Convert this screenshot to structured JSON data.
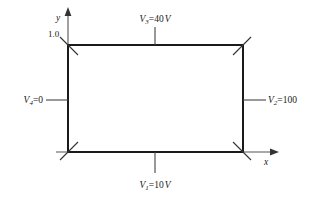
{
  "figure": {
    "type": "boundary-value-diagram",
    "stroke_color": "#1a1a1a",
    "background_color": "#ffffff"
  },
  "axes": {
    "x_label": "x",
    "y_label": "y",
    "y_tick_label": "1.0"
  },
  "boundaries": {
    "top": {
      "symbol": "V",
      "subscript": "3",
      "equals": "=40",
      "unit": "V",
      "full_text": "V3=40 V"
    },
    "right": {
      "symbol": "V",
      "subscript": "2",
      "equals": "=100",
      "unit": "",
      "full_text": "V2=100"
    },
    "bottom": {
      "symbol": "V",
      "subscript": "1",
      "equals": "=10",
      "unit": "V",
      "full_text": "V1=10 V"
    },
    "left": {
      "symbol": "V",
      "subscript": "4",
      "equals": "=0",
      "unit": "",
      "full_text": "V4=0"
    }
  }
}
